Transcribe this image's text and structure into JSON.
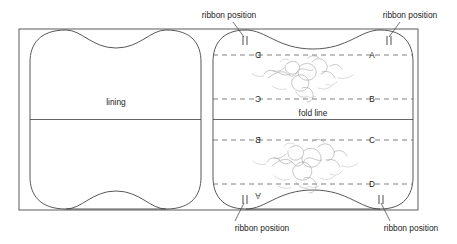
{
  "diagram": {
    "background_color": "#ffffff",
    "line_color": "#4a4a4a",
    "motif_color": "#9a9a9a"
  },
  "labels": {
    "lining": "lining",
    "fold_line": "fold line",
    "ribbon_top_left": "ribbon position",
    "ribbon_top_right": "ribbon position",
    "ribbon_bottom_left": "ribbon position",
    "ribbon_bottom_right": "ribbon position"
  },
  "guide_letters": {
    "upper_panel": [
      {
        "left": "D",
        "right": "A",
        "mirrored_left": true
      },
      {
        "left": "C",
        "right": "B",
        "mirrored_left": true
      }
    ],
    "lower_panel": [
      {
        "left": "B",
        "right": "C",
        "mirrored_left": true
      },
      {
        "left": "A",
        "right": "D",
        "mirrored_left": true
      }
    ]
  },
  "letters": {
    "upper_left_top": "D",
    "upper_right_top": "A",
    "upper_left_bottom": "C",
    "upper_right_bottom": "B",
    "lower_left_top": "B",
    "lower_right_top": "C",
    "lower_left_bottom": "A",
    "lower_right_bottom": "D"
  },
  "panels": {
    "left_panel_name": "lining-panel-left",
    "right_panel_name": "lining-panel-right",
    "motif_count": 2
  }
}
